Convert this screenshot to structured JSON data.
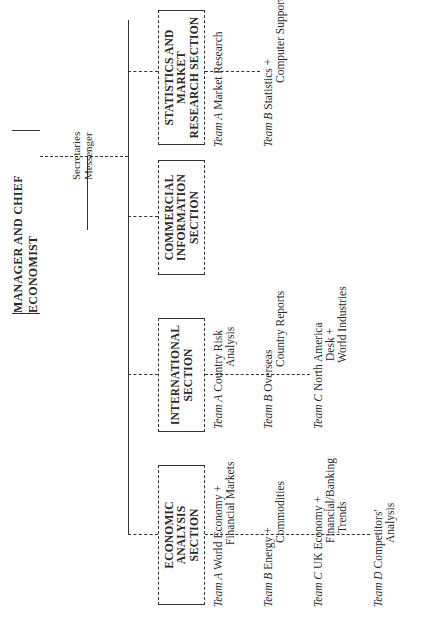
{
  "chart": {
    "orientation": "rotated-90-ccw",
    "manager": {
      "title": "MANAGER AND CHIEF ECONOMIST"
    },
    "support_staff": [
      "Secretaries",
      "Messenger"
    ],
    "sections": [
      {
        "name": "ECONOMIC ANALYSIS SECTION",
        "label_lines": "ECONOMIC\nANALYSIS\nSECTION",
        "teams": [
          {
            "team": "Team",
            "letter": "A",
            "line1": "World Economy +",
            "line2": "Financial Markets"
          },
          {
            "team": "Team",
            "letter": "B",
            "line1": "Energy +",
            "line2": "Commodities"
          },
          {
            "team": "Team",
            "letter": "C",
            "line1": "UK Economy +",
            "line2": "Financial/Banking",
            "line3": "Trends"
          },
          {
            "team": "Team",
            "letter": "D",
            "line1": "Competitors'",
            "line2": "Analysis"
          }
        ]
      },
      {
        "name": "INTERNATIONAL SECTION",
        "label_lines": "INTERNATIONAL\nSECTION",
        "teams": [
          {
            "team": "Team",
            "letter": "A",
            "line1": "Country Risk",
            "line2": "Analysis"
          },
          {
            "team": "Team",
            "letter": "B",
            "line1": "Overseas",
            "line2": "Country Reports"
          },
          {
            "team": "Team",
            "letter": "C",
            "line1": "North America",
            "line2": "Desk +",
            "line3": "World Industries"
          }
        ]
      },
      {
        "name": "COMMERCIAL INFORMATION SECTION",
        "label_lines": "COMMERCIAL\nINFORMATION\nSECTION",
        "teams": []
      },
      {
        "name": "STATISTICS AND MARKET RESEARCH SECTION",
        "label_lines": "STATISTICS AND\nMARKET\nRESEARCH SECTION",
        "teams": [
          {
            "team": "Team",
            "letter": "A",
            "line1": "Market Research"
          },
          {
            "team": "Team",
            "letter": "B",
            "line1": "Statistics +",
            "line2": "Computer Support"
          }
        ]
      }
    ]
  }
}
